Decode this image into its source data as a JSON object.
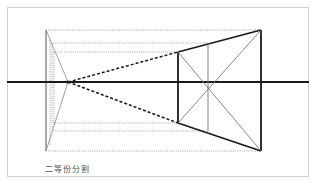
{
  "figure": {
    "caption": "二等份分割",
    "colors": {
      "border": "#cfcfcf",
      "line_bold": "#1a1a1a",
      "line_thin": "#777777",
      "dotted": "#888888",
      "background": "#ffffff"
    },
    "frame": {
      "x": 7,
      "y": 7,
      "width": 140,
      "height": 75
    },
    "horizon_line": {
      "y": 82,
      "x1": 7,
      "x2": 309
    },
    "vanishing_point": {
      "x": 68,
      "y": 82
    },
    "left_edge": {
      "x": 46,
      "y_top": 30,
      "y_bottom": 151
    },
    "trapezoid": {
      "near_edge_x": 261,
      "near_top_y": 30,
      "near_bottom_y": 151,
      "far_edge_x": 178,
      "far_top_y": 52,
      "far_bottom_y": 123,
      "mid_x": 208,
      "mid_top_y": 43,
      "mid_bottom_y": 131
    },
    "dotted_guides_y": [
      30,
      43,
      52,
      123,
      131,
      151
    ]
  }
}
